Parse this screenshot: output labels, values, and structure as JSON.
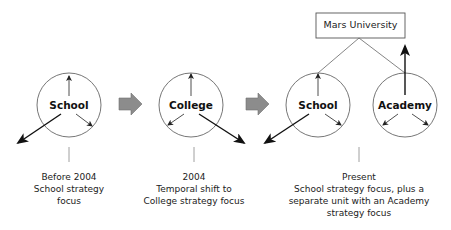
{
  "diagram": {
    "type": "strategy-evolution",
    "top_box": {
      "label": "Mars University"
    },
    "nodes": [
      {
        "id": "school-before",
        "label": "School"
      },
      {
        "id": "college",
        "label": "College"
      },
      {
        "id": "school-present",
        "label": "School"
      },
      {
        "id": "academy",
        "label": "Academy"
      }
    ],
    "stages": [
      {
        "lines": [
          "Before 2004",
          "School strategy",
          "focus"
        ]
      },
      {
        "lines": [
          "2004",
          "Temporal shift to",
          "College strategy focus"
        ]
      },
      {
        "lines": [
          "Present",
          "School strategy focus, plus a",
          "separate unit with an Academy",
          "strategy focus"
        ]
      }
    ],
    "colors": {
      "stroke": "#555555",
      "arrow": "#111111",
      "transition_arrow_fill": "#8c8c8c",
      "transition_arrow_stroke": "#6e6e6e"
    }
  }
}
